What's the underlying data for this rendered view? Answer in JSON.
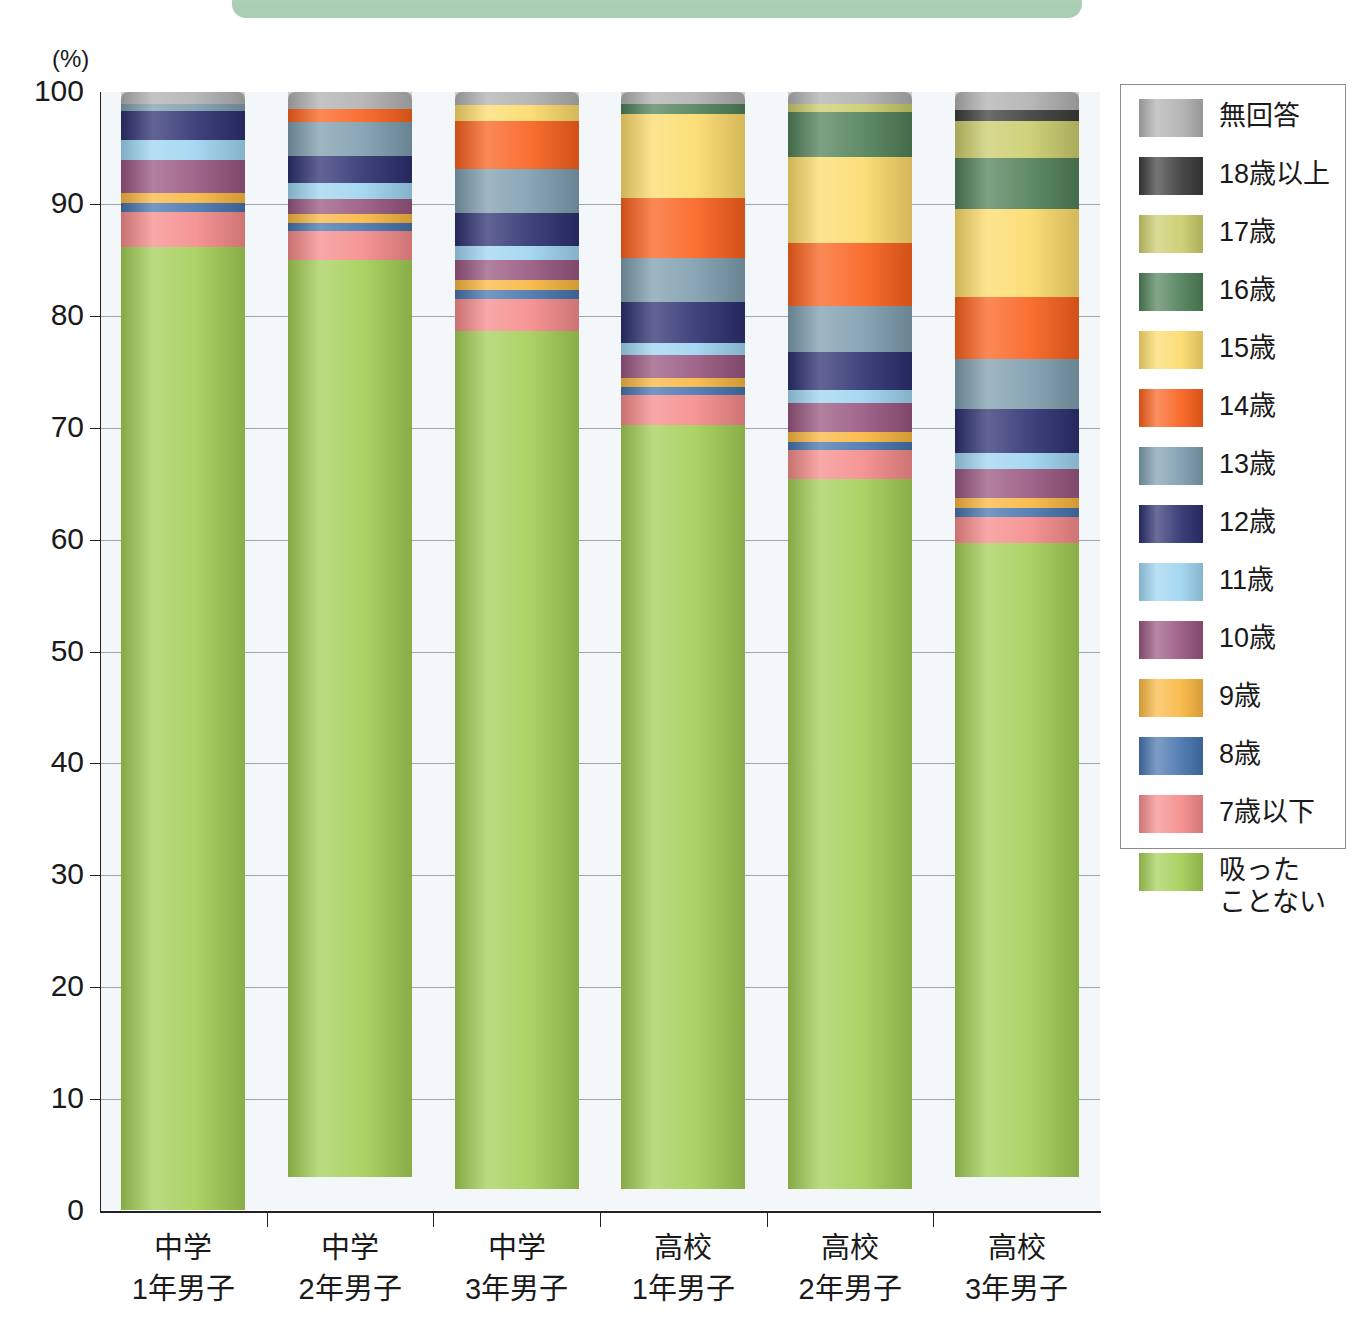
{
  "banner": {
    "color": "#adcfb6"
  },
  "axis": {
    "unit_label": "(%)",
    "y_ticks": [
      "100",
      "90",
      "80",
      "70",
      "60",
      "50",
      "40",
      "30",
      "20",
      "10",
      "0"
    ]
  },
  "legend": {
    "items": [
      {
        "label": "無回答",
        "color": "#b0b0b0"
      },
      {
        "label": "18歳以上",
        "color": "#3a3a3a"
      },
      {
        "label": "17歳",
        "color": "#cbcc6b"
      },
      {
        "label": "16歳",
        "color": "#4f7f58"
      },
      {
        "label": "15歳",
        "color": "#fcdb6a"
      },
      {
        "label": "14歳",
        "color": "#f9601c"
      },
      {
        "label": "13歳",
        "color": "#7d9cad"
      },
      {
        "label": "12歳",
        "color": "#2b2f6e"
      },
      {
        "label": "11歳",
        "color": "#9dd4f0"
      },
      {
        "label": "10歳",
        "color": "#97557e"
      },
      {
        "label": "9歳",
        "color": "#f9b63f"
      },
      {
        "label": "8歳",
        "color": "#4573ad"
      },
      {
        "label": "7歳以下",
        "color": "#f58a8a"
      },
      {
        "label": "吸った\nことない",
        "color": "#a3ce55"
      }
    ]
  },
  "chart_data": {
    "type": "bar",
    "stacked": true,
    "title": "",
    "xlabel": "",
    "ylabel": "(%)",
    "ylim": [
      0,
      100
    ],
    "grid": true,
    "legend_position": "right",
    "categories": [
      "中学\n1年男子",
      "中学\n2年男子",
      "中学\n3年男子",
      "高校\n1年男子",
      "高校\n2年男子",
      "高校\n3年男子"
    ],
    "series": [
      {
        "name": "吸った\nことない",
        "color": "#a3ce55",
        "values": [
          87.0,
          82.0,
          76.6,
          68.2,
          63.4,
          56.7
        ]
      },
      {
        "name": "7歳以下",
        "color": "#f58a8a",
        "values": [
          3.2,
          2.6,
          2.9,
          2.7,
          2.6,
          2.3
        ]
      },
      {
        "name": "8歳",
        "color": "#4573ad",
        "values": [
          0.8,
          0.7,
          0.8,
          0.7,
          0.7,
          0.8
        ]
      },
      {
        "name": "9歳",
        "color": "#f9b63f",
        "values": [
          0.9,
          0.8,
          0.9,
          0.8,
          0.9,
          0.9
        ]
      },
      {
        "name": "10歳",
        "color": "#97557e",
        "values": [
          3.0,
          1.3,
          1.8,
          2.1,
          2.6,
          2.6
        ]
      },
      {
        "name": "11歳",
        "color": "#9dd4f0",
        "values": [
          1.8,
          1.5,
          1.2,
          1.1,
          1.2,
          1.4
        ]
      },
      {
        "name": "12歳",
        "color": "#2b2f6e",
        "values": [
          2.6,
          2.4,
          3.0,
          3.6,
          3.4,
          4.0
        ]
      },
      {
        "name": "13歳",
        "color": "#7d9cad",
        "values": [
          0.6,
          3.0,
          3.9,
          4.0,
          4.1,
          4.4
        ]
      },
      {
        "name": "14歳",
        "color": "#f9601c",
        "values": [
          0.0,
          1.2,
          4.3,
          5.3,
          5.6,
          5.6
        ]
      },
      {
        "name": "15歳",
        "color": "#fcdb6a",
        "values": [
          0.0,
          0.0,
          1.4,
          7.5,
          7.7,
          7.8
        ]
      },
      {
        "name": "16歳",
        "color": "#4f7f58",
        "values": [
          0.0,
          0.0,
          0.0,
          0.9,
          4.0,
          4.6
        ]
      },
      {
        "name": "17歳",
        "color": "#cbcc6b",
        "values": [
          0.0,
          0.0,
          0.0,
          0.0,
          0.7,
          3.3
        ]
      },
      {
        "name": "18歳以上",
        "color": "#3a3a3a",
        "values": [
          0.0,
          0.0,
          0.0,
          0.0,
          0.0,
          1.0
        ]
      },
      {
        "name": "無回答",
        "color": "#b0b0b0",
        "values": [
          1.1,
          1.5,
          1.2,
          1.1,
          1.1,
          1.6
        ]
      }
    ]
  }
}
